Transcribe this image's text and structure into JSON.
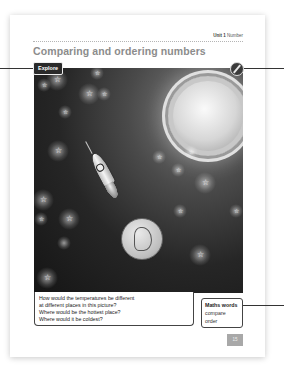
{
  "header": {
    "unit_label": "Unit 1",
    "unit_topic": "Number"
  },
  "title": "Comparing and ordering numbers",
  "explore_tag": "Explore",
  "scene": {
    "description": "Space scene with sun, rocket, Earth and stars",
    "elements": [
      "sun",
      "rocket",
      "earth",
      "stars"
    ]
  },
  "questions": [
    "How would the temperatures be different",
    "at different places in this picture?",
    "Where would be the hottest place?",
    "Where would it be coldest?"
  ],
  "maths_words": {
    "heading": "Maths words",
    "words": [
      "compare",
      "order"
    ]
  },
  "page_number": "15",
  "icons": {
    "pencil": "pencil-icon"
  },
  "colors": {
    "title": "#8c8c8c",
    "tag_bg": "#2a2a2a",
    "page_num_bg": "#a8a8a8"
  }
}
